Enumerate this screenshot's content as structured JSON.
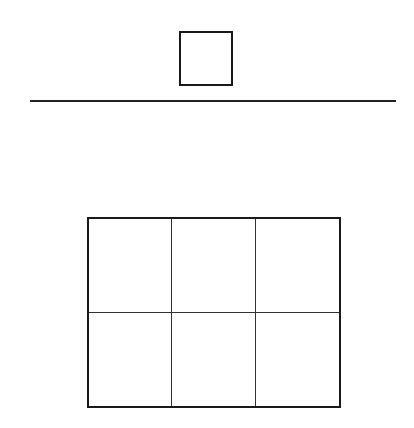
{
  "target_die": {
    "value": 3
  },
  "dice_row": [
    {
      "value": 1
    },
    {
      "value": 2
    },
    {
      "value": 3
    },
    {
      "value": 4
    },
    {
      "value": 5
    },
    {
      "value": 6
    }
  ],
  "grid": {
    "cells": [
      {
        "label": "1",
        "highlighted": false
      },
      {
        "label": "2",
        "highlighted": false
      },
      {
        "label": "3",
        "highlighted": true
      },
      {
        "label": "4",
        "highlighted": false
      },
      {
        "label": "5",
        "highlighted": false
      },
      {
        "label": "6",
        "highlighted": false
      }
    ],
    "highlight_color": "#d9d9d9"
  }
}
